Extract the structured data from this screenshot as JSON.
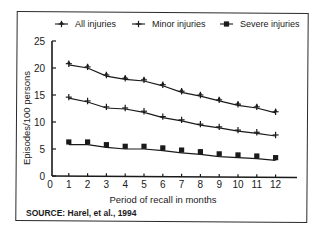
{
  "chart_data": {
    "type": "line",
    "title": "",
    "xlabel": "Period of recall in months",
    "ylabel": "Episodes/100 persons",
    "xlim": [
      0,
      12
    ],
    "ylim": [
      0,
      25
    ],
    "x_ticks": [
      0,
      1,
      2,
      3,
      4,
      5,
      6,
      7,
      8,
      9,
      10,
      11,
      12
    ],
    "y_ticks": [
      0,
      5,
      10,
      15,
      20,
      25
    ],
    "grid": false,
    "legend_position": "top",
    "x": [
      1,
      2,
      3,
      4,
      5,
      6,
      7,
      8,
      9,
      10,
      11,
      12
    ],
    "series": [
      {
        "name": "All injuries",
        "marker": "asterisk",
        "values": [
          20.8,
          20.2,
          18.7,
          18.1,
          17.8,
          16.9,
          15.7,
          15.0,
          14.1,
          13.3,
          12.8,
          11.9
        ]
      },
      {
        "name": "Minor injuries",
        "marker": "plus",
        "values": [
          14.6,
          13.9,
          12.8,
          12.6,
          12.0,
          11.0,
          10.4,
          9.6,
          9.1,
          8.5,
          8.1,
          7.6
        ]
      },
      {
        "name": "Severe injuries",
        "marker": "square",
        "values": [
          6.3,
          6.3,
          5.8,
          5.5,
          5.5,
          5.2,
          4.8,
          4.5,
          4.1,
          3.9,
          3.7,
          3.4
        ]
      }
    ],
    "annotations": [
      "SOURCE: Harel, et al., 1994"
    ]
  },
  "legend": {
    "items": [
      {
        "label": "All injuries",
        "marker": "asterisk-line-icon"
      },
      {
        "label": "Minor injuries",
        "marker": "plus-line-icon"
      },
      {
        "label": "Severe injuries",
        "marker": "square-line-icon"
      }
    ]
  },
  "axes": {
    "xlabel": "Period of recall in months",
    "ylabel": "Episodes/100 persons"
  },
  "source": "SOURCE:  Harel, et al., 1994",
  "colors": {
    "ink": "#1a1a1a",
    "background": "#ffffff"
  }
}
